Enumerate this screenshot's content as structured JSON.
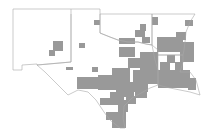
{
  "map": {
    "type": "choropleth",
    "region": "South Central United States",
    "states": [
      "New Mexico",
      "Oklahoma",
      "Texas",
      "Arkansas",
      "Louisiana"
    ],
    "colors": {
      "background": "#ffffff",
      "outline": "#a8a8a8",
      "shaded": "#999999"
    },
    "legend": null,
    "title": null
  }
}
